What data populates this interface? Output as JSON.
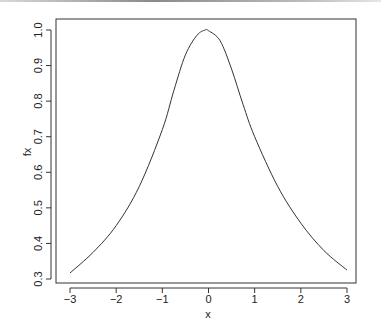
{
  "chart_data": {
    "type": "line",
    "title": "",
    "xlabel": "x",
    "ylabel": "fx",
    "xlim": [
      -3,
      3
    ],
    "ylim": [
      0.3,
      1.0
    ],
    "grid": false,
    "legend": null,
    "x_ticks": [
      "−3",
      "−2",
      "−1",
      "0",
      "1",
      "2",
      "3"
    ],
    "x_tick_values": [
      -3,
      -2,
      -1,
      0,
      1,
      2,
      3
    ],
    "y_ticks": [
      "0.3",
      "0.4",
      "0.5",
      "0.6",
      "0.7",
      "0.8",
      "0.9",
      "1.0"
    ],
    "y_tick_values": [
      0.3,
      0.4,
      0.5,
      0.6,
      0.7,
      0.8,
      0.9,
      1.0
    ],
    "series": [
      {
        "name": "fx",
        "color": "#333333",
        "x": [
          -3,
          -2.5,
          -2,
          -1.5,
          -1,
          -0.75,
          -0.5,
          -0.25,
          -0.07,
          0,
          0.25,
          0.5,
          0.75,
          1,
          1.5,
          2,
          2.5,
          3
        ],
        "y": [
          0.317,
          0.375,
          0.45,
          0.56,
          0.72,
          0.83,
          0.93,
          0.985,
          1.0,
          0.998,
          0.97,
          0.89,
          0.79,
          0.7,
          0.56,
          0.457,
          0.38,
          0.325
        ]
      }
    ]
  }
}
